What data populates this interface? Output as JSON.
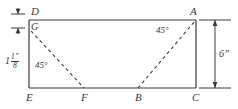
{
  "figure": {
    "type": "geometry-diagram",
    "shape": "rectangle with two dashed 45 degree diagonals",
    "background_color": "#ffffff",
    "line_color": "#3a3a3a",
    "vertex_labels": {
      "D": "D",
      "A": "A",
      "G": "G",
      "E": "E",
      "F": "F",
      "B": "B",
      "C": "C"
    },
    "angles": {
      "left": "45°",
      "right": "45°"
    },
    "dimensions": {
      "left": {
        "whole": "1",
        "numerator": "1”",
        "denominator": "8"
      },
      "right": "6”"
    }
  }
}
